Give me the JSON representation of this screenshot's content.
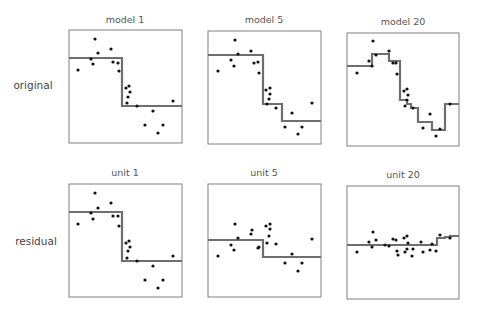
{
  "chart_data": {
    "type": "scatter",
    "row_labels": [
      "original",
      "residual"
    ],
    "colors": {
      "frame": "#8a8a8a",
      "step_line": "#6e6e6e",
      "points": "#111111",
      "text": "#555555"
    },
    "panels": [
      {
        "title": "model 1",
        "row": 0,
        "box": [
          69,
          30,
          182,
          143
        ],
        "step": [
          [
            69,
            58
          ],
          [
            122,
            58
          ],
          [
            122,
            106
          ],
          [
            182,
            106
          ]
        ],
        "points": [
          [
            95,
            39
          ],
          [
            98,
            53
          ],
          [
            91,
            59
          ],
          [
            93,
            64
          ],
          [
            111,
            49
          ],
          [
            113,
            62
          ],
          [
            118,
            63
          ],
          [
            119,
            71
          ],
          [
            78,
            70
          ],
          [
            126,
            88
          ],
          [
            129,
            86
          ],
          [
            130,
            92
          ],
          [
            128,
            97
          ],
          [
            127,
            103
          ],
          [
            137,
            106
          ],
          [
            153,
            111
          ],
          [
            145,
            125
          ],
          [
            173,
            101
          ],
          [
            163,
            125
          ],
          [
            158,
            133
          ]
        ]
      },
      {
        "title": "model 5",
        "row": 0,
        "box": [
          208,
          31,
          321,
          144
        ],
        "step": [
          [
            208,
            55
          ],
          [
            263,
            55
          ],
          [
            263,
            104
          ],
          [
            282,
            104
          ],
          [
            282,
            121
          ],
          [
            321,
            121
          ]
        ],
        "points": [
          [
            235,
            40
          ],
          [
            238,
            54
          ],
          [
            231,
            60
          ],
          [
            234,
            66
          ],
          [
            251,
            51
          ],
          [
            254,
            63
          ],
          [
            258,
            62
          ],
          [
            259,
            73
          ],
          [
            218,
            71
          ],
          [
            266,
            90
          ],
          [
            270,
            88
          ],
          [
            270,
            94
          ],
          [
            269,
            99
          ],
          [
            267,
            104
          ],
          [
            276,
            108
          ],
          [
            292,
            113
          ],
          [
            285,
            127
          ],
          [
            312,
            103
          ],
          [
            302,
            127
          ],
          [
            298,
            134
          ]
        ]
      },
      {
        "title": "model 20",
        "row": 0,
        "box": [
          347,
          33,
          459,
          146
        ],
        "step": [
          [
            347,
            66
          ],
          [
            372,
            66
          ],
          [
            372,
            54
          ],
          [
            389,
            54
          ],
          [
            389,
            61
          ],
          [
            400,
            61
          ],
          [
            400,
            100
          ],
          [
            407,
            100
          ],
          [
            407,
            104
          ],
          [
            411,
            104
          ],
          [
            411,
            108
          ],
          [
            418,
            108
          ],
          [
            418,
            122
          ],
          [
            432,
            122
          ],
          [
            432,
            130
          ],
          [
            445,
            130
          ],
          [
            445,
            104
          ],
          [
            459,
            104
          ]
        ],
        "points": [
          [
            373,
            41
          ],
          [
            376,
            55
          ],
          [
            369,
            61
          ],
          [
            372,
            66
          ],
          [
            389,
            51
          ],
          [
            393,
            63
          ],
          [
            396,
            63
          ],
          [
            397,
            74
          ],
          [
            357,
            73
          ],
          [
            404,
            91
          ],
          [
            407,
            89
          ],
          [
            408,
            95
          ],
          [
            407,
            100
          ],
          [
            405,
            106
          ],
          [
            413,
            108
          ],
          [
            430,
            114
          ],
          [
            423,
            128
          ],
          [
            450,
            104
          ],
          [
            440,
            129
          ],
          [
            436,
            136
          ]
        ]
      },
      {
        "title": "unit 1",
        "row": 1,
        "box": [
          69,
          184,
          182,
          297
        ],
        "step": [
          [
            69,
            212
          ],
          [
            122,
            212
          ],
          [
            122,
            261
          ],
          [
            182,
            261
          ]
        ],
        "points": [
          [
            95,
            193
          ],
          [
            98,
            208
          ],
          [
            91,
            213
          ],
          [
            93,
            219
          ],
          [
            111,
            203
          ],
          [
            113,
            216
          ],
          [
            118,
            216
          ],
          [
            119,
            226
          ],
          [
            78,
            224
          ],
          [
            126,
            243
          ],
          [
            129,
            241
          ],
          [
            130,
            247
          ],
          [
            128,
            251
          ],
          [
            127,
            258
          ],
          [
            137,
            261
          ],
          [
            153,
            266
          ],
          [
            145,
            280
          ],
          [
            173,
            256
          ],
          [
            163,
            280
          ],
          [
            158,
            288
          ]
        ]
      },
      {
        "title": "unit 5",
        "row": 1,
        "box": [
          208,
          184,
          321,
          297
        ],
        "step": [
          [
            208,
            240
          ],
          [
            263,
            240
          ],
          [
            263,
            257
          ],
          [
            321,
            257
          ]
        ],
        "points": [
          [
            235,
            224
          ],
          [
            238,
            238
          ],
          [
            231,
            245
          ],
          [
            234,
            250
          ],
          [
            251,
            234
          ],
          [
            252,
            230
          ],
          [
            258,
            248
          ],
          [
            259,
            247
          ],
          [
            218,
            256
          ],
          [
            266,
            226
          ],
          [
            270,
            224
          ],
          [
            270,
            229
          ],
          [
            269,
            236
          ],
          [
            267,
            243
          ],
          [
            276,
            244
          ],
          [
            292,
            254
          ],
          [
            285,
            263
          ],
          [
            312,
            239
          ],
          [
            302,
            263
          ],
          [
            298,
            271
          ]
        ]
      },
      {
        "title": "unit 20",
        "row": 1,
        "box": [
          347,
          186,
          459,
          299
        ],
        "step": [
          [
            347,
            245
          ],
          [
            437,
            245
          ],
          [
            437,
            238
          ],
          [
            445,
            238
          ],
          [
            445,
            237
          ],
          [
            450,
            237
          ],
          [
            450,
            236
          ],
          [
            459,
            236
          ]
        ],
        "points": [
          [
            373,
            232
          ],
          [
            376,
            240
          ],
          [
            369,
            242
          ],
          [
            372,
            247
          ],
          [
            389,
            246
          ],
          [
            393,
            239
          ],
          [
            396,
            240
          ],
          [
            397,
            251
          ],
          [
            357,
            252
          ],
          [
            404,
            238
          ],
          [
            407,
            236
          ],
          [
            408,
            243
          ],
          [
            407,
            249
          ],
          [
            405,
            252
          ],
          [
            413,
            249
          ],
          [
            430,
            250
          ],
          [
            423,
            252
          ],
          [
            450,
            238
          ],
          [
            440,
            235
          ],
          [
            436,
            251
          ],
          [
            385,
            245
          ],
          [
            398,
            255
          ],
          [
            412,
            256
          ],
          [
            421,
            242
          ],
          [
            432,
            244
          ]
        ]
      }
    ]
  }
}
